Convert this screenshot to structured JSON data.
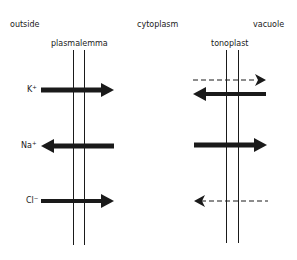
{
  "regions": {
    "outside": "outside",
    "cytoplasm": "cytoplasm",
    "vacuole": "vacuole"
  },
  "membranes": {
    "plasmalemma": "plasmalemma",
    "tonoplast": "tonoplast"
  },
  "ions": [
    {
      "symbol": "K",
      "charge": "+"
    },
    {
      "symbol": "Na",
      "charge": "+"
    },
    {
      "symbol": "Cl",
      "charge": "−"
    }
  ],
  "arrows": {
    "plasmalemma": [
      {
        "ion": "K+",
        "direction": "inward",
        "style": "solid"
      },
      {
        "ion": "Na+",
        "direction": "outward",
        "style": "solid"
      },
      {
        "ion": "Cl-",
        "direction": "inward",
        "style": "solid"
      }
    ],
    "tonoplast": [
      {
        "ion": "K+",
        "direction": "into-vacuole",
        "style": "dashed"
      },
      {
        "ion": "K+",
        "direction": "out-of-vacuole",
        "style": "solid"
      },
      {
        "ion": "Na+",
        "direction": "into-vacuole",
        "style": "solid"
      },
      {
        "ion": "Cl-",
        "direction": "out-of-vacuole",
        "style": "dashed"
      }
    ]
  },
  "colors": {
    "line": "#1a1a1a",
    "background": "#ffffff"
  }
}
